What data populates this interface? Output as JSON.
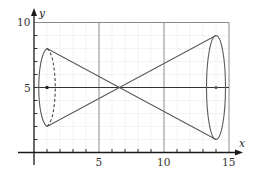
{
  "diagram": {
    "title": "",
    "type": "double-cone (two cones joined at vertex) on coordinate grid",
    "axes": {
      "x_label": "x",
      "y_label": "y",
      "x_ticks": [
        "5",
        "10",
        "15"
      ],
      "y_ticks": [
        "5",
        "10"
      ],
      "x_range": [
        0,
        15
      ],
      "y_range": [
        0,
        10
      ],
      "grid": "minor 1-unit dashed, major every 5 units"
    },
    "shapes": {
      "left_ellipse": {
        "center": [
          1,
          5
        ],
        "vertical_semi_axis": 3,
        "top": [
          1,
          8
        ],
        "bottom": [
          1,
          2
        ],
        "back_side": "dashed"
      },
      "right_ellipse": {
        "center": [
          14,
          5
        ],
        "vertical_semi_axis": 4,
        "top": [
          14,
          9
        ],
        "bottom": [
          14,
          1
        ]
      },
      "lines": [
        {
          "from": [
            1,
            8
          ],
          "to": [
            14,
            1
          ]
        },
        {
          "from": [
            1,
            2
          ],
          "to": [
            14,
            9
          ]
        }
      ],
      "center_line": {
        "y": 5,
        "from_x": 0,
        "to_x": 15
      },
      "center_dots": [
        [
          1,
          5
        ],
        [
          14,
          5
        ]
      ]
    },
    "colors": {
      "curve": "#5a5a5a",
      "grid_minor": "#dcdcdc",
      "grid_major": "#6e6e6e",
      "axis": "#1a1a1a"
    }
  }
}
